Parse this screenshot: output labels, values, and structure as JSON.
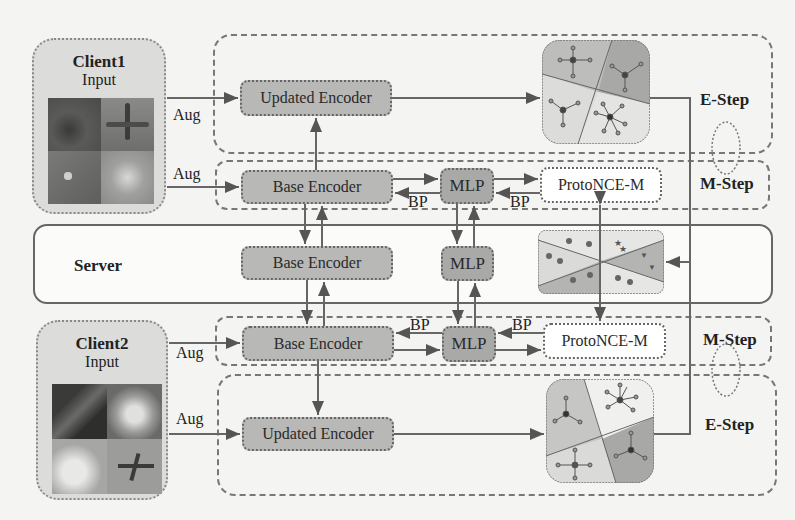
{
  "figure": {
    "client1": {
      "title": "Client1",
      "subtitle": "Input",
      "images": [
        "forest-photo",
        "airplane-photo",
        "bird-photo",
        "flower-photo"
      ]
    },
    "client2": {
      "title": "Client2",
      "subtitle": "Input",
      "images": [
        "branch-photo",
        "shiba-dog-photo",
        "white-dog-photo",
        "airplane-photo"
      ]
    },
    "server": {
      "label": "Server"
    },
    "aug_label": "Aug",
    "bp_label": "BP",
    "boxes": {
      "updated_encoder": "Updated Encoder",
      "base_encoder": "Base Encoder",
      "mlp": "MLP",
      "protonce": "ProtoNCE-M"
    },
    "steps": {
      "e_step": "E-Step",
      "m_step": "M-Step"
    },
    "colors": {
      "encoder_fill": "#b8b8b6",
      "mlp_fill": "#a9a9a7",
      "client_fill": "#dcdcdb",
      "cluster_dark": "#a8a8a6",
      "cluster_light": "#d6d6d4",
      "cluster_white": "#eeeeec"
    }
  }
}
